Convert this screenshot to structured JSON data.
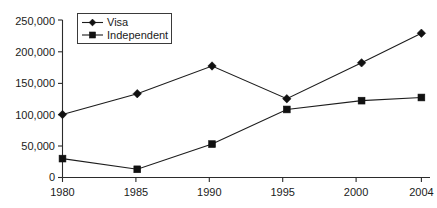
{
  "chart_data": {
    "type": "line",
    "title": "",
    "xlabel": "",
    "ylabel": "",
    "x": [
      1980,
      1985,
      1990,
      1995,
      2000,
      2004
    ],
    "categories": [
      "1980",
      "1985",
      "1990",
      "1995",
      "2000",
      "2004"
    ],
    "xtick_labels": [
      "1980",
      "1985",
      "1990",
      "1995",
      "2000",
      "2004"
    ],
    "ytick_labels": [
      "0",
      "50,000",
      "100,000",
      "150,000",
      "200,000",
      "250,000"
    ],
    "ytick_values": [
      0,
      50000,
      100000,
      150000,
      200000,
      250000
    ],
    "ylim": [
      0,
      250000
    ],
    "xlim": [
      1980,
      2004
    ],
    "grid": false,
    "legend_position": "top-left-inside",
    "series": [
      {
        "name": "Visa",
        "marker": "diamond",
        "color": "#111111",
        "values": [
          100000,
          133000,
          177000,
          125000,
          182000,
          229000
        ]
      },
      {
        "name": "Independent",
        "marker": "square",
        "color": "#111111",
        "values": [
          30000,
          13000,
          53000,
          108000,
          122000,
          127000
        ]
      }
    ]
  },
  "legend": {
    "entries": [
      {
        "label": "Visa",
        "marker": "diamond-icon"
      },
      {
        "label": "Independent",
        "marker": "square-icon"
      }
    ]
  },
  "colors": {
    "background": "#ffffff",
    "axis": "#2b2b2b",
    "line": "#1d1d1d",
    "text": "#1b1b1b"
  }
}
